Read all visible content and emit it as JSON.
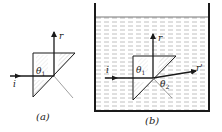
{
  "figure": {
    "panel_a": {
      "caption": "(a)",
      "labels": {
        "incident": "i",
        "reflected": "r",
        "theta": "θ",
        "theta_sub": "1"
      },
      "medium": "air"
    },
    "panel_b": {
      "caption": "(b)",
      "labels": {
        "incident": "i",
        "reflected": "r",
        "refracted": "r'",
        "theta1": "θ",
        "theta1_sub": "1",
        "theta2": "θ",
        "theta2_sub": "2"
      },
      "medium": "liquid"
    },
    "colors": {
      "ink": "#1a1a1a",
      "hatch": "#9a9a9a",
      "liquid_dash": "#b0b0b0",
      "background": "#ffffff"
    }
  }
}
